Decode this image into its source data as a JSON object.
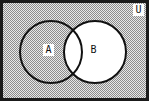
{
  "diagram": {
    "type": "venn",
    "universe_label": "U",
    "sets": [
      {
        "label": "A",
        "cx": 51,
        "cy": 52,
        "r": 31,
        "shaded": true
      },
      {
        "label": "B",
        "cx": 95,
        "cy": 52,
        "r": 31,
        "shaded": false
      }
    ],
    "shaded_region": "U \\ B",
    "colors": {
      "frame": "#1a1a1a",
      "shade_dark": "#8c8c8c",
      "shade_light": "#e8e8e8",
      "unshaded": "#ffffff",
      "stroke": "#111111"
    }
  }
}
